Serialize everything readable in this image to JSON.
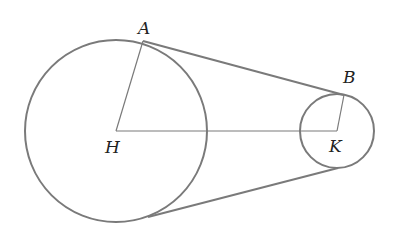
{
  "diagram": {
    "type": "two circles with external tangent belt",
    "stroke_color": "#7a7a7a",
    "points": {
      "A": {
        "label": "A"
      },
      "B": {
        "label": "B"
      },
      "H": {
        "label": "H"
      },
      "K": {
        "label": "K"
      }
    },
    "elements": [
      "large circle centered at H",
      "small circle centered at K",
      "segment HA (radius)",
      "segment KB (radius)",
      "segment HK (center line)",
      "upper tangent AB",
      "lower tangent"
    ]
  }
}
